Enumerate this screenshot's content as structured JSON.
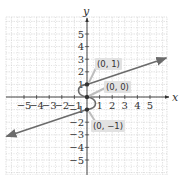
{
  "chart_data": {
    "type": "line",
    "title": "",
    "xlabel": "x",
    "ylabel": "y",
    "xlim": [
      -6.3,
      6.3
    ],
    "ylim": [
      -6.3,
      6.3
    ],
    "grid": true,
    "x_ticks": [
      "-5",
      "-4",
      "-3",
      "-2",
      "-1",
      "1",
      "2",
      "3",
      "4",
      "5"
    ],
    "y_ticks": [
      "5",
      "4",
      "3",
      "2",
      "1",
      "-1",
      "-2",
      "-3",
      "-4",
      "-5"
    ],
    "series": [
      {
        "name": "upper ray",
        "points": [
          [
            0,
            1
          ],
          [
            6,
            3
          ]
        ],
        "arrow": "end"
      },
      {
        "name": "S-curve",
        "points": [
          [
            0,
            1
          ],
          [
            -0.5,
            0.5
          ],
          [
            0,
            0
          ],
          [
            0.5,
            -0.5
          ],
          [
            0,
            -1
          ]
        ]
      },
      {
        "name": "lower ray",
        "points": [
          [
            0,
            -1
          ],
          [
            -6,
            -3
          ]
        ],
        "arrow": "end"
      }
    ],
    "annotations": [
      {
        "text": "(0, 1)",
        "point": [
          0,
          1
        ]
      },
      {
        "text": "(0, 0)",
        "point": [
          0,
          0
        ]
      },
      {
        "text": "(0, −1)",
        "point": [
          0,
          -1
        ]
      }
    ],
    "colors": {
      "curve": "#6b6b6b",
      "grid": "#cfcfcf",
      "axis": "#333333",
      "label_bg": "#e2e2e2"
    }
  },
  "labels": {
    "p1": "(0, 1)",
    "p0": "(0, 0)",
    "pm1": "(0, −1)",
    "x_axis": "x",
    "y_axis": "y"
  }
}
